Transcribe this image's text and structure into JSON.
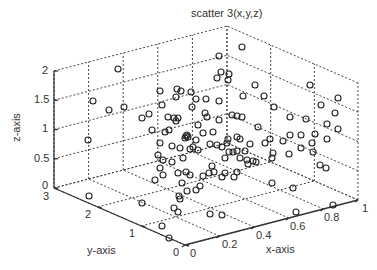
{
  "chart_data": {
    "type": "scatter",
    "subtype": "scatter3d",
    "title": "scatter 3(x,y,z)",
    "xlabel": "x-axis",
    "ylabel": "y-axis",
    "zlabel": "z-axis",
    "xlim": [
      0,
      1
    ],
    "ylim": [
      0,
      3
    ],
    "zlim": [
      0,
      2
    ],
    "xticks": [
      "0",
      "0.2",
      "0.4",
      "0.6",
      "0.8",
      "1"
    ],
    "yticks": [
      "0",
      "1",
      "2",
      "3"
    ],
    "zticks": [
      "0",
      "0.5",
      "1",
      "1.5",
      "2"
    ],
    "grid": true,
    "marker": "open-circle",
    "marker_color": "#222222",
    "point_count_approx": 130,
    "screen_points": [
      [
        118,
        69
      ],
      [
        242,
        47
      ],
      [
        219,
        56
      ],
      [
        221,
        72
      ],
      [
        217,
        78
      ],
      [
        229,
        74
      ],
      [
        228,
        80
      ],
      [
        255,
        85
      ],
      [
        310,
        85
      ],
      [
        338,
        98
      ],
      [
        93,
        101
      ],
      [
        109,
        110
      ],
      [
        124,
        107
      ],
      [
        160,
        91
      ],
      [
        177,
        89
      ],
      [
        181,
        91
      ],
      [
        176,
        97
      ],
      [
        191,
        92
      ],
      [
        196,
        99
      ],
      [
        206,
        99
      ],
      [
        162,
        105
      ],
      [
        192,
        107
      ],
      [
        219,
        101
      ],
      [
        243,
        96
      ],
      [
        264,
        96
      ],
      [
        274,
        107
      ],
      [
        321,
        105
      ],
      [
        335,
        113
      ],
      [
        232,
        115
      ],
      [
        237,
        116
      ],
      [
        242,
        117
      ],
      [
        205,
        113
      ],
      [
        207,
        117
      ],
      [
        142,
        118
      ],
      [
        149,
        114
      ],
      [
        168,
        117
      ],
      [
        174,
        118
      ],
      [
        176,
        121
      ],
      [
        178,
        118
      ],
      [
        198,
        125
      ],
      [
        219,
        120
      ],
      [
        258,
        127
      ],
      [
        290,
        117
      ],
      [
        306,
        119
      ],
      [
        327,
        124
      ],
      [
        338,
        129
      ],
      [
        152,
        130
      ],
      [
        165,
        132
      ],
      [
        169,
        130
      ],
      [
        203,
        133
      ],
      [
        213,
        132
      ],
      [
        237,
        137
      ],
      [
        270,
        139
      ],
      [
        290,
        135
      ],
      [
        301,
        135
      ],
      [
        315,
        134
      ],
      [
        228,
        139
      ],
      [
        227,
        143
      ],
      [
        240,
        139
      ],
      [
        250,
        144
      ],
      [
        265,
        143
      ],
      [
        283,
        141
      ],
      [
        312,
        143
      ],
      [
        327,
        139
      ],
      [
        88,
        140
      ],
      [
        186,
        136
      ],
      [
        185,
        138
      ],
      [
        188,
        137
      ],
      [
        187,
        135
      ],
      [
        196,
        140
      ],
      [
        160,
        143
      ],
      [
        172,
        146
      ],
      [
        180,
        148
      ],
      [
        193,
        147
      ],
      [
        210,
        144
      ],
      [
        217,
        145
      ],
      [
        222,
        147
      ],
      [
        229,
        152
      ],
      [
        233,
        152
      ],
      [
        237,
        151
      ],
      [
        245,
        151
      ],
      [
        273,
        153
      ],
      [
        289,
        154
      ],
      [
        301,
        148
      ],
      [
        313,
        152
      ],
      [
        198,
        150
      ],
      [
        158,
        155
      ],
      [
        163,
        160
      ],
      [
        172,
        162
      ],
      [
        183,
        158
      ],
      [
        190,
        149
      ],
      [
        225,
        158
      ],
      [
        240,
        158
      ],
      [
        247,
        160
      ],
      [
        253,
        161
      ],
      [
        256,
        162
      ],
      [
        272,
        158
      ],
      [
        320,
        165
      ],
      [
        326,
        168
      ],
      [
        212,
        166
      ],
      [
        178,
        173
      ],
      [
        186,
        172
      ],
      [
        190,
        175
      ],
      [
        203,
        176
      ],
      [
        209,
        173
      ],
      [
        214,
        172
      ],
      [
        222,
        177
      ],
      [
        225,
        173
      ],
      [
        248,
        164
      ],
      [
        237,
        172
      ],
      [
        160,
        168
      ],
      [
        163,
        175
      ],
      [
        155,
        180
      ],
      [
        182,
        183
      ],
      [
        187,
        191
      ],
      [
        196,
        190
      ],
      [
        200,
        186
      ],
      [
        234,
        177
      ],
      [
        272,
        183
      ],
      [
        293,
        188
      ],
      [
        89,
        196
      ],
      [
        142,
        203
      ],
      [
        180,
        199
      ],
      [
        179,
        196
      ],
      [
        174,
        208
      ],
      [
        178,
        212
      ],
      [
        210,
        214
      ],
      [
        162,
        226
      ],
      [
        222,
        215
      ],
      [
        296,
        212
      ],
      [
        333,
        205
      ],
      [
        169,
        238
      ]
    ]
  },
  "figure": {
    "title": "scatter 3(x,y,z)",
    "xlabel": "x-axis",
    "ylabel": "y-axis",
    "zlabel": "z-axis",
    "xtick_labels": [
      "0",
      "0.2",
      "0.4",
      "0.6",
      "0.8",
      "1"
    ],
    "ytick_labels": [
      "0",
      "1",
      "2",
      "3"
    ],
    "ztick_labels": [
      "0",
      "0.5",
      "1",
      "1.5",
      "2"
    ],
    "colors": {
      "axis": "#333333",
      "grid": "#444444",
      "marker": "#222222",
      "background": "#ffffff"
    }
  }
}
